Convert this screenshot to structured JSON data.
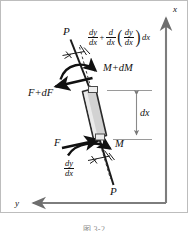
{
  "figure": {
    "kind": "free-body-diagram",
    "title_caption": "图 3-2",
    "axes": {
      "x_label": "x",
      "y_label": "y",
      "x_direction": "up",
      "y_direction": "left",
      "color": "#808080"
    },
    "element": {
      "name": "beam-differential-element",
      "fill": "#d0d0d0",
      "stroke": "#262626"
    },
    "labels": {
      "p_top": "P",
      "p_bottom": "P",
      "f_top": "F+dF",
      "f_bottom": "F",
      "m_top": "M+dM",
      "m_bottom": "M",
      "dx_dimension": "dx"
    },
    "slope_top": {
      "term1_num": "dy",
      "term1_den": "dx",
      "operator": "+",
      "term2_num": "d",
      "term2_den": "dx",
      "open_paren": "(",
      "term3_num": "dy",
      "term3_den": "dx",
      "close_paren": ")",
      "tail": "dx"
    },
    "slope_bottom": {
      "num": "dy",
      "den": "dx"
    }
  }
}
